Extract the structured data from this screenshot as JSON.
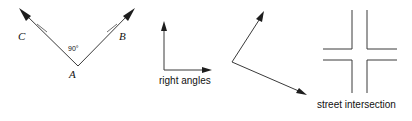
{
  "diagram": {
    "background_color": "#ffffff",
    "line_color": "#3a3a3a",
    "text_color": "#111111",
    "figures": [
      {
        "id": "angle-a-90",
        "name": "labeled-right-angle",
        "vertex_label": "A",
        "ray_labels": [
          "C",
          "B"
        ],
        "angle_measure": "90°",
        "tick_marks": 2,
        "arrowheads": 2
      },
      {
        "id": "right-angles-axes",
        "name": "perpendicular-rays",
        "caption": "right angles",
        "arrowheads": 2
      },
      {
        "id": "bent-angle",
        "name": "open-angle-rays",
        "caption": "",
        "arrowheads": 2
      },
      {
        "id": "street-intersection",
        "name": "crossroads",
        "caption": "street intersection",
        "road_count": 2
      }
    ]
  },
  "labels": {
    "vertex_a": "A",
    "ray_c": "C",
    "ray_b": "B",
    "angle_90": "90°"
  },
  "captions": {
    "right_angles": "right angles",
    "street_intersection": "street intersection"
  }
}
